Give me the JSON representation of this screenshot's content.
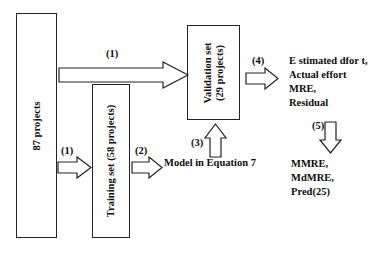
{
  "diagram": {
    "boxes": [
      {
        "id": "all-projects",
        "label": "87 projects",
        "orientation": "vertical"
      },
      {
        "id": "training-set",
        "label": "Training set  (58 projects)",
        "orientation": "vertical"
      },
      {
        "id": "validation-set",
        "label": "Validation set\n(29 projects)",
        "orientation": "vertical"
      }
    ],
    "text_blocks": [
      {
        "id": "model-equation",
        "label": "Model in Equation 7"
      },
      {
        "id": "metrics-raw",
        "label": "E stimated dfor t,\nActual effort\nMRE,\nResidual"
      },
      {
        "id": "metrics-agg",
        "label": "MMRE,\nMdMRE,\nPred(25)"
      }
    ],
    "arrows": [
      {
        "id": "split-validation",
        "label": "(1)",
        "direction": "right",
        "from": "all-projects",
        "to": "validation-set"
      },
      {
        "id": "split-training",
        "label": "(1)",
        "direction": "right",
        "from": "all-projects",
        "to": "training-set"
      },
      {
        "id": "training-model",
        "label": "(2)",
        "direction": "right",
        "from": "training-set",
        "to": "model-equation"
      },
      {
        "id": "model-validation",
        "label": "(3)",
        "direction": "up",
        "from": "model-equation",
        "to": "validation-set"
      },
      {
        "id": "validation-eval",
        "label": "(4)",
        "direction": "right",
        "from": "validation-set",
        "to": "metrics-raw"
      },
      {
        "id": "eval-aggregate",
        "label": "(5)",
        "direction": "down",
        "from": "metrics-raw",
        "to": "metrics-agg"
      }
    ],
    "colors": {
      "stroke": "#222222",
      "fill": "#ffffff",
      "text": "#0d0d0d"
    }
  }
}
